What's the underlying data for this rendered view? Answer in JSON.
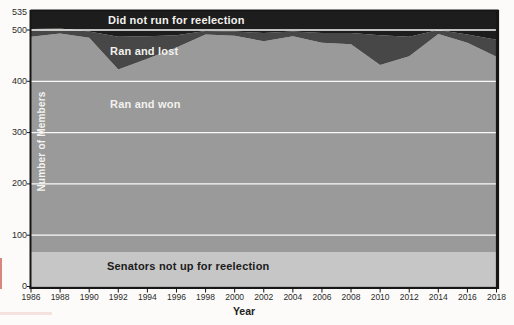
{
  "labels": {
    "did_not_run": "Did not run for reelection",
    "ran_and_lost": "Ran and lost",
    "ran_and_won": "Ran and won",
    "senators_not_up": "Senators not up for reelection",
    "y_axis_title": "Number of Members",
    "x_axis_title": "Year"
  },
  "colors": {
    "did_not_run": "#1d1d1d",
    "ran_and_lost": "#474747",
    "ran_and_won": "#9a9a9a",
    "senators_not_up": "#c6c6c6",
    "gridline": "#faf9f7",
    "axis": "#161616",
    "tick_text": "#2b2b2b"
  },
  "chart_data": {
    "type": "area",
    "stacked": true,
    "title": "",
    "xlabel": "Year",
    "ylabel": "Number of Members",
    "ylim": [
      0,
      535
    ],
    "yticks": [
      535,
      500,
      400,
      300,
      200,
      100,
      0
    ],
    "gridline_values": [
      500,
      400,
      300,
      200,
      100
    ],
    "grid": true,
    "legend_position": "labels-inside-areas",
    "x": [
      1986,
      1988,
      1990,
      1992,
      1994,
      1996,
      1998,
      2000,
      2002,
      2004,
      2006,
      2008,
      2010,
      2012,
      2014,
      2016,
      2018
    ],
    "series": [
      {
        "name": "Senators not up for reelection",
        "color": "#c6c6c6",
        "values": [
          67,
          67,
          67,
          67,
          67,
          67,
          67,
          67,
          67,
          67,
          67,
          67,
          67,
          67,
          67,
          67,
          67
        ]
      },
      {
        "name": "Ran and won",
        "color": "#9a9a9a",
        "values": [
          420,
          426,
          418,
          356,
          377,
          399,
          424,
          422,
          411,
          421,
          408,
          405,
          365,
          382,
          425,
          408,
          381
        ]
      },
      {
        "name": "Ran and lost",
        "color": "#474747",
        "values": [
          15,
          10,
          12,
          64,
          44,
          24,
          7,
          8,
          16,
          9,
          19,
          22,
          58,
          38,
          8,
          16,
          33
        ]
      },
      {
        "name": "Did not run for reelection",
        "color": "#1d1d1d",
        "values": [
          33,
          32,
          38,
          48,
          47,
          45,
          37,
          38,
          41,
          38,
          41,
          41,
          45,
          48,
          35,
          44,
          54
        ]
      }
    ],
    "total_members": 535
  }
}
